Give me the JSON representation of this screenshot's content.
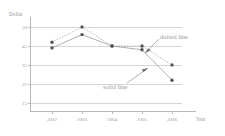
{
  "chart_data": {
    "type": "line",
    "title": "",
    "xlabel": "Year",
    "ylabel": "Dollar",
    "categories": [
      "2002",
      "2003",
      "2004",
      "2005",
      "2006"
    ],
    "x": [
      2002,
      2003,
      2004,
      2005,
      2006
    ],
    "yticks": [
      50,
      45,
      35,
      25,
      15
    ],
    "ylim": [
      15,
      50
    ],
    "grid": true,
    "legend_position": "inline-annotations",
    "series": [
      {
        "name": "dotted line",
        "style": "dotted",
        "marker": "circle",
        "color": "#555555",
        "values": [
          46,
          50,
          45,
          45,
          35
        ]
      },
      {
        "name": "solid line",
        "style": "solid",
        "marker": "circle",
        "color": "#555555",
        "values": [
          44,
          48,
          45,
          43,
          27
        ]
      }
    ],
    "annotations": [
      {
        "text": "dotted line",
        "points_to_series": "dotted line"
      },
      {
        "text": "solid line",
        "points_to_series": "solid line"
      }
    ]
  },
  "axes": {
    "y_title": "Dollar",
    "x_title": "Year",
    "y_tick_labels": [
      "50",
      "45",
      "35",
      "25",
      "15"
    ],
    "x_tick_labels": [
      "2002",
      "2003",
      "2004",
      "2005",
      "2006"
    ]
  },
  "annotations": {
    "dotted": "dotted line",
    "solid": "solid line"
  },
  "colors": {
    "axis": "#b9b9b9",
    "grid": "#d6d6d6",
    "text": "#9a9a9a",
    "marker": "#555555",
    "line": "#8c8c8c",
    "background": "#ffffff"
  }
}
